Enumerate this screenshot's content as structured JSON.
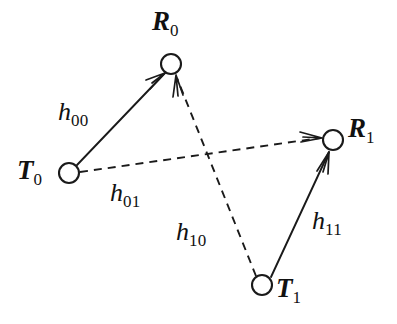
{
  "figure": {
    "background_color": "#ffffff",
    "stroke_color": "#1a1a1a",
    "width": 397,
    "height": 324
  },
  "nodes": [
    {
      "id": "R0",
      "role": "receiver",
      "base": "R",
      "sub": "0",
      "cx": 171,
      "cy": 64,
      "r": 10,
      "label_x": 152,
      "label_y": 8
    },
    {
      "id": "T0",
      "role": "transmitter",
      "base": "T",
      "sub": "0",
      "cx": 69,
      "cy": 173,
      "r": 10,
      "label_x": 17,
      "label_y": 157
    },
    {
      "id": "R1",
      "role": "receiver",
      "base": "R",
      "sub": "1",
      "cx": 333,
      "cy": 140,
      "r": 10,
      "label_x": 348,
      "label_y": 115
    },
    {
      "id": "T1",
      "role": "transmitter",
      "base": "T",
      "sub": "1",
      "cx": 262,
      "cy": 285,
      "r": 10,
      "label_x": 276,
      "label_y": 275
    }
  ],
  "links": [
    {
      "id": "h00",
      "from": "T0",
      "to": "R0",
      "style": "solid",
      "x1": 77,
      "y1": 165,
      "x2": 165,
      "y2": 73,
      "label_base": "h",
      "label_sub": "00",
      "label_x": 58,
      "label_y": 99
    },
    {
      "id": "h01",
      "from": "T0",
      "to": "R1",
      "style": "dashed",
      "x1": 80,
      "y1": 172,
      "x2": 322,
      "y2": 138,
      "label_base": "h",
      "label_sub": "01",
      "label_x": 110,
      "label_y": 180
    },
    {
      "id": "h10",
      "from": "T1",
      "to": "R0",
      "style": "dashed",
      "x1": 256,
      "y1": 276,
      "x2": 176,
      "y2": 75,
      "label_base": "h",
      "label_sub": "10",
      "label_x": 176,
      "label_y": 219
    },
    {
      "id": "h11",
      "from": "T1",
      "to": "R1",
      "style": "solid",
      "x1": 271,
      "y1": 277,
      "x2": 329,
      "y2": 152,
      "label_base": "h",
      "label_sub": "11",
      "label_x": 312,
      "label_y": 208
    }
  ]
}
